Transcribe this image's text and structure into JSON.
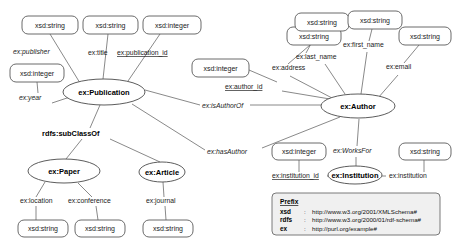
{
  "diagram": {
    "background": "#ffffff",
    "node_stroke": "#5a5a5a",
    "edge_stroke": "#6b6b6b",
    "legend_fill": "#f0f0f0"
  },
  "classes": [
    {
      "id": "publication",
      "label": "ex:Publication",
      "cx": 104,
      "cy": 92,
      "rx": 41,
      "ry": 13
    },
    {
      "id": "author",
      "label": "ex:Author",
      "cx": 358,
      "cy": 106,
      "rx": 37,
      "ry": 12
    },
    {
      "id": "paper",
      "label": "ex:Paper",
      "cx": 64,
      "cy": 171,
      "rx": 36,
      "ry": 12
    },
    {
      "id": "article",
      "label": "ex:Article",
      "cx": 162,
      "cy": 172,
      "rx": 23,
      "ry": 10
    },
    {
      "id": "institution",
      "label": "ex:Institution",
      "cx": 355,
      "cy": 175,
      "rx": 27,
      "ry": 9
    }
  ],
  "literals": [
    {
      "id": "lit-publisher",
      "label": "xsd:string",
      "x": 22,
      "y": 16,
      "w": 56,
      "h": 18
    },
    {
      "id": "lit-title",
      "label": "xsd:string",
      "x": 83,
      "y": 16,
      "w": 55,
      "h": 18
    },
    {
      "id": "lit-publication-id",
      "label": "xsd:integer",
      "x": 143,
      "y": 16,
      "w": 58,
      "h": 18
    },
    {
      "id": "lit-year",
      "label": "xsd:integer",
      "x": 10,
      "y": 64,
      "w": 54,
      "h": 18
    },
    {
      "id": "lit-author-id",
      "label": "xsd:integer",
      "x": 192,
      "y": 59,
      "w": 57,
      "h": 18
    },
    {
      "id": "lit-address",
      "label": "xsd:string",
      "x": 287,
      "y": 27,
      "w": 54,
      "h": 18
    },
    {
      "id": "lit-last-name",
      "label": "xsd:string",
      "x": 295,
      "y": 13,
      "w": 54,
      "h": 18
    },
    {
      "id": "lit-first-name",
      "label": "xsd:string",
      "x": 348,
      "y": 11,
      "w": 54,
      "h": 18
    },
    {
      "id": "lit-email",
      "label": "xsd:string",
      "x": 399,
      "y": 27,
      "w": 52,
      "h": 18
    },
    {
      "id": "lit-location",
      "label": "xsd:string",
      "x": 18,
      "y": 220,
      "w": 50,
      "h": 17
    },
    {
      "id": "lit-conference",
      "label": "xsd:string",
      "x": 75,
      "y": 220,
      "w": 50,
      "h": 17
    },
    {
      "id": "lit-journal",
      "label": "xsd:string",
      "x": 143,
      "y": 220,
      "w": 50,
      "h": 17
    },
    {
      "id": "lit-institution-id",
      "label": "xsd:integer",
      "x": 272,
      "y": 143,
      "w": 54,
      "h": 17
    },
    {
      "id": "lit-institution",
      "label": "xsd:string",
      "x": 399,
      "y": 143,
      "w": 52,
      "h": 17
    }
  ],
  "properties": [
    {
      "id": "ex-publisher",
      "label": "ex:publisher",
      "x": 13,
      "y": 54,
      "style": "italic"
    },
    {
      "id": "ex-title",
      "label": "ex:title",
      "x": 88,
      "y": 55,
      "style": "plain"
    },
    {
      "id": "ex-publication-id",
      "label": "ex:publication_id",
      "x": 117,
      "y": 55,
      "style": "underline"
    },
    {
      "id": "ex-year",
      "label": "ex:year",
      "x": 19,
      "y": 100,
      "style": "italic"
    },
    {
      "id": "ex-author-id",
      "label": "ex:author_id",
      "x": 225,
      "y": 89,
      "style": "underline"
    },
    {
      "id": "ex-address",
      "label": "ex:address",
      "x": 272,
      "y": 70,
      "style": "plain"
    },
    {
      "id": "ex-last-name",
      "label": "ex:last_name",
      "x": 296,
      "y": 59,
      "style": "plain"
    },
    {
      "id": "ex-first-name",
      "label": "ex:first_name",
      "x": 343,
      "y": 47,
      "style": "plain"
    },
    {
      "id": "ex-email",
      "label": "ex:email",
      "x": 386,
      "y": 69,
      "style": "plain"
    },
    {
      "id": "ex-is-author-of",
      "label": "ex:isAuthorOf",
      "x": 202,
      "y": 108,
      "style": "italic"
    },
    {
      "id": "ex-has-author",
      "label": "ex:hasAuthor",
      "x": 207,
      "y": 154,
      "style": "italic"
    },
    {
      "id": "ex-location",
      "label": "ex:location",
      "x": 20,
      "y": 203,
      "style": "plain"
    },
    {
      "id": "ex-conference",
      "label": "ex:conference",
      "x": 68,
      "y": 203,
      "style": "plain"
    },
    {
      "id": "ex-journal",
      "label": "ex:journal",
      "x": 146,
      "y": 203,
      "style": "plain"
    },
    {
      "id": "ex-works-for",
      "label": "ex:WorksFor",
      "x": 333,
      "y": 153,
      "style": "italic"
    },
    {
      "id": "ex-institution-id",
      "label": "ex:institution_id",
      "x": 272,
      "y": 178,
      "style": "underline"
    },
    {
      "id": "ex-institution",
      "label": "ex:institution",
      "x": 389,
      "y": 178,
      "style": "plain"
    },
    {
      "id": "rdfs-subclassof",
      "label": "rdfs:subClassOf",
      "x": 42,
      "y": 136,
      "style": "bold"
    }
  ],
  "edges": [
    {
      "id": "e-publisher",
      "x1": 50,
      "y1": 34,
      "x2": 80,
      "y2": 83
    },
    {
      "id": "e-title",
      "x1": 108,
      "y1": 34,
      "x2": 103,
      "y2": 79
    },
    {
      "id": "e-publication-id",
      "x1": 160,
      "y1": 34,
      "x2": 128,
      "y2": 81
    },
    {
      "id": "e-year",
      "x1": 37,
      "y1": 82,
      "x2": 38,
      "y2": 93
    },
    {
      "id": "e-year2",
      "x1": 52,
      "y1": 103,
      "x2": 70,
      "y2": 97
    },
    {
      "id": "e-isauthorof-l",
      "x1": 145,
      "y1": 90,
      "x2": 200,
      "y2": 105
    },
    {
      "id": "e-isauthorof-r",
      "x1": 250,
      "y1": 105,
      "x2": 321,
      "y2": 105
    },
    {
      "id": "e-hasauthor-l",
      "x1": 132,
      "y1": 104,
      "x2": 205,
      "y2": 150
    },
    {
      "id": "e-hasauthor-r",
      "x1": 262,
      "y1": 148,
      "x2": 340,
      "y2": 117
    },
    {
      "id": "e-authorid",
      "x1": 249,
      "y1": 70,
      "x2": 277,
      "y2": 82
    },
    {
      "id": "e-authorid2",
      "x1": 282,
      "y1": 91,
      "x2": 330,
      "y2": 99
    },
    {
      "id": "e-address",
      "x1": 310,
      "y1": 45,
      "x2": 288,
      "y2": 64
    },
    {
      "id": "e-address2",
      "x1": 290,
      "y1": 76,
      "x2": 332,
      "y2": 98
    },
    {
      "id": "e-lastname",
      "x1": 318,
      "y1": 31,
      "x2": 306,
      "y2": 53
    },
    {
      "id": "e-lastname2",
      "x1": 325,
      "y1": 64,
      "x2": 345,
      "y2": 94
    },
    {
      "id": "e-firstname",
      "x1": 372,
      "y1": 29,
      "x2": 369,
      "y2": 41
    },
    {
      "id": "e-firstname2",
      "x1": 367,
      "y1": 52,
      "x2": 361,
      "y2": 94
    },
    {
      "id": "e-email",
      "x1": 419,
      "y1": 45,
      "x2": 404,
      "y2": 63
    },
    {
      "id": "e-email2",
      "x1": 398,
      "y1": 75,
      "x2": 378,
      "y2": 98
    },
    {
      "id": "e-sub-left",
      "x1": 82,
      "y1": 139,
      "x2": 66,
      "y2": 159
    },
    {
      "id": "e-sub-up",
      "x1": 90,
      "y1": 128,
      "x2": 100,
      "y2": 105
    },
    {
      "id": "e-sub-right",
      "x1": 110,
      "y1": 139,
      "x2": 160,
      "y2": 162
    },
    {
      "id": "e-location",
      "x1": 45,
      "y1": 182,
      "x2": 36,
      "y2": 197
    },
    {
      "id": "e-location2",
      "x1": 36,
      "y1": 206,
      "x2": 36,
      "y2": 220
    },
    {
      "id": "e-conference",
      "x1": 78,
      "y1": 183,
      "x2": 92,
      "y2": 197
    },
    {
      "id": "e-conference2",
      "x1": 96,
      "y1": 206,
      "x2": 98,
      "y2": 220
    },
    {
      "id": "e-journal",
      "x1": 163,
      "y1": 182,
      "x2": 164,
      "y2": 197
    },
    {
      "id": "e-journal2",
      "x1": 165,
      "y1": 206,
      "x2": 166,
      "y2": 220
    },
    {
      "id": "e-worksfor-up",
      "x1": 357,
      "y1": 146,
      "x2": 359,
      "y2": 119
    },
    {
      "id": "e-worksfor-dn",
      "x1": 356,
      "y1": 157,
      "x2": 356,
      "y2": 166
    },
    {
      "id": "e-instid-v",
      "x1": 299,
      "y1": 160,
      "x2": 299,
      "y2": 172
    },
    {
      "id": "e-instid-h",
      "x1": 327,
      "y1": 176,
      "x2": 335,
      "y2": 176
    },
    {
      "id": "e-inst-v",
      "x1": 424,
      "y1": 160,
      "x2": 424,
      "y2": 172
    },
    {
      "id": "e-inst-h",
      "x1": 375,
      "y1": 176,
      "x2": 386,
      "y2": 176
    }
  ],
  "legend": {
    "box": {
      "x": 272,
      "y": 193,
      "w": 168,
      "h": 42
    },
    "title": "Prefix",
    "rows": [
      {
        "prefix": "xsd",
        "sep": ":",
        "uri": "http://www.w3.org/2001/XMLSchema#"
      },
      {
        "prefix": "rdfs",
        "sep": ":",
        "uri": "http://www.w3.org/2000/01/rdf-schema#"
      },
      {
        "prefix": "ex",
        "sep": ":",
        "uri": "http://purl.org/example#"
      }
    ]
  }
}
